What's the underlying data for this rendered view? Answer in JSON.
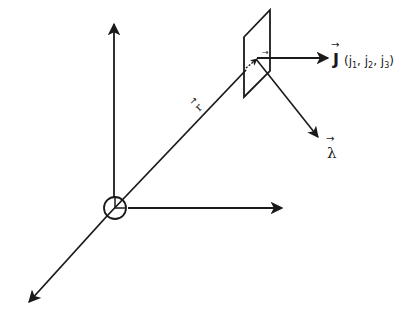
{
  "diagram": {
    "colors": {
      "ink": "#1a1a1a",
      "background": "#ffffff"
    },
    "labels": {
      "position_vector": "r",
      "local_vector": "r",
      "current_density": "J",
      "current_components": "(j",
      "j1_sub": "1",
      "j2_prefix": ", j",
      "j2_sub": "2",
      "j3_prefix": ", j",
      "j3_sub": "3",
      "close_paren": ")",
      "direction_vector": "λ",
      "vector_arrow": "→"
    },
    "elements": [
      "vertical-axis",
      "horizontal-axis",
      "depth-axis",
      "origin-marker",
      "position-vector-line",
      "surface-element",
      "current-density-arrow",
      "lambda-arrow"
    ]
  }
}
